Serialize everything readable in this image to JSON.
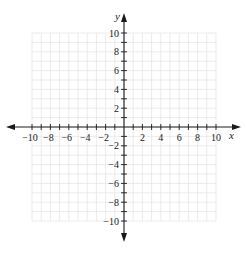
{
  "chart_data": {
    "type": "scatter",
    "title": "",
    "xlabel": "x",
    "ylabel": "y",
    "xlim": [
      -10,
      10
    ],
    "ylim": [
      -10,
      10
    ],
    "grid": true,
    "minor_grid_step": 1,
    "x_tick_labels": [
      "-10",
      "-8",
      "-6",
      "-4",
      "-2",
      "2",
      "4",
      "6",
      "8",
      "10"
    ],
    "y_tick_labels": [
      "10",
      "8",
      "6",
      "4",
      "2",
      "-2",
      "-4",
      "-6",
      "-8",
      "-10"
    ],
    "series": [],
    "colors": {
      "axis": "#1a1a1a",
      "grid": "#e6e6e6"
    }
  }
}
